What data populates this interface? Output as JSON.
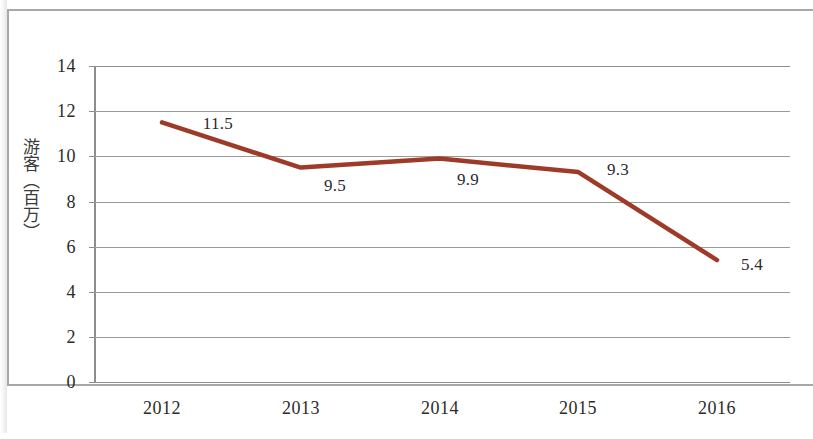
{
  "chart_data": {
    "type": "line",
    "title": "",
    "subtitle": "",
    "xlabel": "",
    "ylabel": "游客（百万）",
    "categories": [
      "2012",
      "2013",
      "2014",
      "2015",
      "2016"
    ],
    "values": [
      11.5,
      9.5,
      9.9,
      9.3,
      5.4
    ],
    "point_labels": [
      "11.5",
      "9.5",
      "9.9",
      "9.3",
      "5.4"
    ],
    "series": [
      {
        "name": "游客（百万）",
        "values": [
          11.5,
          9.5,
          9.9,
          9.3,
          5.4
        ],
        "color": "#9E3B28"
      }
    ],
    "ylim": [
      0,
      14
    ],
    "y_ticks": [
      "0",
      "2",
      "4",
      "6",
      "8",
      "10",
      "12",
      "14"
    ],
    "y_tick_values": [
      0,
      2,
      4,
      6,
      8,
      10,
      12,
      14
    ],
    "x_ticks": [
      "2012",
      "2013",
      "2014",
      "2015",
      "2016"
    ],
    "grid": "horizontal",
    "legend": "none",
    "legend_position": "none",
    "line_color": "#9E3B28",
    "grid_color": "#9A9A9A",
    "axis_color": "#8D8D8D",
    "markers": "none",
    "annotations": []
  },
  "figure": {
    "y_axis_title": "游客（百万）",
    "frame": "scanned-page-border"
  }
}
